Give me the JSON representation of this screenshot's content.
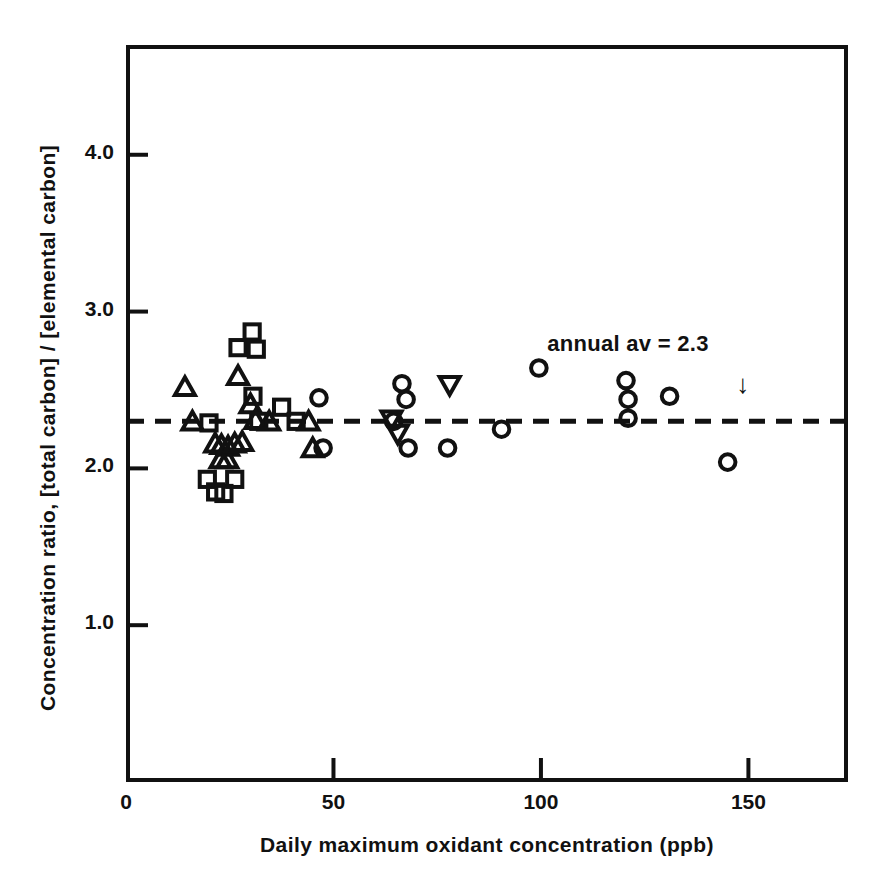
{
  "chart_data": {
    "type": "scatter",
    "title": "",
    "xlabel": "Daily maximum oxidant concentration (ppb)",
    "ylabel": "Concentration ratio, [total carbon] / [elemental carbon]",
    "xlim": [
      0,
      174
    ],
    "ylim": [
      0,
      4.7
    ],
    "xticks": [
      0,
      50,
      100,
      150
    ],
    "xtick_labels": [
      "0",
      "50",
      "100",
      "150"
    ],
    "yticks": [
      1.0,
      2.0,
      3.0,
      4.0
    ],
    "ytick_labels": [
      "1.0",
      "2.0",
      "3.0",
      "4.0"
    ],
    "grid": false,
    "legend": "none",
    "reference_line": {
      "label": "annual av = 2.3",
      "value": 2.3,
      "style": "dashed",
      "orientation": "horizontal"
    },
    "annotations": [
      {
        "text": "annual av = 2.3",
        "x": 128,
        "y": 2.78
      },
      {
        "text": "down-arrow",
        "x": 149,
        "y": 2.53
      }
    ],
    "series": [
      {
        "name": "triangle-up",
        "marker": "triangle-up",
        "points": [
          [
            14.2,
            2.52
          ],
          [
            16.0,
            2.3
          ],
          [
            21.5,
            2.16
          ],
          [
            23.0,
            2.15
          ],
          [
            24.6,
            2.14
          ],
          [
            22.8,
            2.06
          ],
          [
            24.4,
            2.06
          ],
          [
            26.2,
            2.16
          ],
          [
            28.0,
            2.17
          ],
          [
            27.0,
            2.59
          ],
          [
            30.0,
            2.41
          ],
          [
            31.2,
            2.31
          ],
          [
            34.5,
            2.3
          ],
          [
            44.0,
            2.3
          ],
          [
            45.0,
            2.13
          ]
        ]
      },
      {
        "name": "square",
        "marker": "square",
        "points": [
          [
            20.0,
            2.29
          ],
          [
            19.6,
            1.93
          ],
          [
            21.6,
            1.85
          ],
          [
            23.6,
            1.84
          ],
          [
            26.2,
            1.93
          ],
          [
            27.0,
            2.77
          ],
          [
            30.4,
            2.87
          ],
          [
            31.4,
            2.76
          ],
          [
            30.6,
            2.46
          ],
          [
            32.0,
            2.3
          ],
          [
            37.5,
            2.39
          ],
          [
            41.0,
            2.3
          ]
        ]
      },
      {
        "name": "circle",
        "marker": "circle",
        "points": [
          [
            46.5,
            2.45
          ],
          [
            47.5,
            2.13
          ],
          [
            64.5,
            2.3
          ],
          [
            66.5,
            2.54
          ],
          [
            67.5,
            2.44
          ],
          [
            68.0,
            2.13
          ],
          [
            77.5,
            2.13
          ],
          [
            90.5,
            2.25
          ],
          [
            99.5,
            2.64
          ],
          [
            120.5,
            2.56
          ],
          [
            121.0,
            2.44
          ],
          [
            121.0,
            2.32
          ],
          [
            131.0,
            2.46
          ],
          [
            145.0,
            2.04
          ]
        ]
      },
      {
        "name": "triangle-down",
        "marker": "triangle-down",
        "points": [
          [
            64.0,
            2.31
          ],
          [
            65.5,
            2.22
          ],
          [
            78.0,
            2.53
          ]
        ]
      }
    ]
  }
}
